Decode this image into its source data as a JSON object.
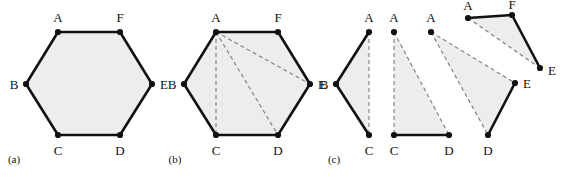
{
  "figure": {
    "width": 568,
    "height": 177,
    "background_color": "#ffffff",
    "fill_color": "#ededed",
    "solid_edge_color": "#111111",
    "dashed_edge_color": "#7d7d7d",
    "vertex_color": "#111111"
  },
  "panels": [
    {
      "id": "a",
      "caption": "(a)",
      "caption_pos": {
        "x": 14,
        "y": 159
      },
      "description": "convex hexagon ABCDEF",
      "polygon_points": "58,32 120,32 152,84 120,135 58,135 26,84",
      "solid_edges": [
        {
          "x1": 58,
          "y1": 32,
          "x2": 120,
          "y2": 32
        },
        {
          "x1": 120,
          "y1": 32,
          "x2": 152,
          "y2": 84
        },
        {
          "x1": 152,
          "y1": 84,
          "x2": 120,
          "y2": 135
        },
        {
          "x1": 120,
          "y1": 135,
          "x2": 58,
          "y2": 135
        },
        {
          "x1": 58,
          "y1": 135,
          "x2": 26,
          "y2": 84
        },
        {
          "x1": 26,
          "y1": 84,
          "x2": 58,
          "y2": 32
        }
      ],
      "dashed_edges": [],
      "vertices": [
        {
          "label": "A",
          "x": 58,
          "y": 32,
          "lx": 58,
          "ly": 17
        },
        {
          "label": "F",
          "x": 120,
          "y": 32,
          "lx": 120,
          "ly": 17
        },
        {
          "label": "E",
          "x": 152,
          "y": 84,
          "lx": 164,
          "ly": 84
        },
        {
          "label": "D",
          "x": 120,
          "y": 135,
          "lx": 120,
          "ly": 150
        },
        {
          "label": "C",
          "x": 58,
          "y": 135,
          "lx": 58,
          "ly": 150
        },
        {
          "label": "B",
          "x": 26,
          "y": 84,
          "lx": 14,
          "ly": 84
        }
      ]
    },
    {
      "id": "b",
      "caption": "(b)",
      "caption_pos": {
        "x": 175,
        "y": 159
      },
      "description": "hexagon ABCDEF with dashed diagonals from A to C, D and E",
      "polygon_points": "216,32 278,32 310,84 278,135 216,135 184,84",
      "solid_edges": [
        {
          "x1": 216,
          "y1": 32,
          "x2": 278,
          "y2": 32
        },
        {
          "x1": 278,
          "y1": 32,
          "x2": 310,
          "y2": 84
        },
        {
          "x1": 310,
          "y1": 84,
          "x2": 278,
          "y2": 135
        },
        {
          "x1": 278,
          "y1": 135,
          "x2": 216,
          "y2": 135
        },
        {
          "x1": 216,
          "y1": 135,
          "x2": 184,
          "y2": 84
        },
        {
          "x1": 184,
          "y1": 84,
          "x2": 216,
          "y2": 32
        }
      ],
      "dashed_edges": [
        {
          "x1": 216,
          "y1": 32,
          "x2": 216,
          "y2": 135
        },
        {
          "x1": 216,
          "y1": 32,
          "x2": 278,
          "y2": 135
        },
        {
          "x1": 216,
          "y1": 32,
          "x2": 310,
          "y2": 84
        }
      ],
      "vertices": [
        {
          "label": "A",
          "x": 216,
          "y": 32,
          "lx": 216,
          "ly": 17
        },
        {
          "label": "F",
          "x": 278,
          "y": 32,
          "lx": 278,
          "ly": 17
        },
        {
          "label": "E",
          "x": 310,
          "y": 84,
          "lx": 322,
          "ly": 84
        },
        {
          "label": "D",
          "x": 278,
          "y": 135,
          "lx": 278,
          "ly": 150
        },
        {
          "label": "C",
          "x": 216,
          "y": 135,
          "lx": 216,
          "ly": 150
        },
        {
          "label": "B",
          "x": 184,
          "y": 84,
          "lx": 172,
          "ly": 84
        }
      ]
    },
    {
      "id": "c",
      "caption": "(c)",
      "caption_pos": {
        "x": 334,
        "y": 159
      },
      "description": "the four triangles ABC, ACD, ADE and AEF obtained by the triangulation",
      "triangles": [
        {
          "name": "triangle-abc",
          "polygon_points": "369,32 336,84 369,135",
          "solid_edges": [
            {
              "x1": 369,
              "y1": 32,
              "x2": 336,
              "y2": 84
            },
            {
              "x1": 336,
              "y1": 84,
              "x2": 369,
              "y2": 135
            }
          ],
          "dashed_edges": [
            {
              "x1": 369,
              "y1": 32,
              "x2": 369,
              "y2": 135
            }
          ],
          "vertices": [
            {
              "label": "A",
              "x": 369,
              "y": 32,
              "lx": 369,
              "ly": 17
            },
            {
              "label": "B",
              "x": 336,
              "y": 84,
              "lx": 324,
              "ly": 84
            },
            {
              "label": "C",
              "x": 369,
              "y": 135,
              "lx": 369,
              "ly": 150
            }
          ]
        },
        {
          "name": "triangle-acd",
          "polygon_points": "394,32 394,135 449,135",
          "solid_edges": [
            {
              "x1": 394,
              "y1": 135,
              "x2": 449,
              "y2": 135
            }
          ],
          "dashed_edges": [
            {
              "x1": 394,
              "y1": 32,
              "x2": 394,
              "y2": 135
            },
            {
              "x1": 394,
              "y1": 32,
              "x2": 449,
              "y2": 135
            }
          ],
          "vertices": [
            {
              "label": "A",
              "x": 394,
              "y": 32,
              "lx": 394,
              "ly": 17
            },
            {
              "label": "C",
              "x": 394,
              "y": 135,
              "lx": 394,
              "ly": 150
            },
            {
              "label": "D",
              "x": 449,
              "y": 135,
              "lx": 449,
              "ly": 150
            }
          ]
        },
        {
          "name": "triangle-ade",
          "polygon_points": "431,32 488,135 515,83",
          "solid_edges": [
            {
              "x1": 488,
              "y1": 135,
              "x2": 515,
              "y2": 83
            }
          ],
          "dashed_edges": [
            {
              "x1": 431,
              "y1": 32,
              "x2": 488,
              "y2": 135
            },
            {
              "x1": 431,
              "y1": 32,
              "x2": 515,
              "y2": 83
            }
          ],
          "vertices": [
            {
              "label": "A",
              "x": 431,
              "y": 32,
              "lx": 431,
              "ly": 17
            },
            {
              "label": "D",
              "x": 488,
              "y": 135,
              "lx": 488,
              "ly": 150
            },
            {
              "label": "E",
              "x": 515,
              "y": 83,
              "lx": 527,
              "ly": 83
            }
          ]
        },
        {
          "name": "triangle-aef",
          "polygon_points": "468,18 512,15 540,68",
          "solid_edges": [
            {
              "x1": 468,
              "y1": 18,
              "x2": 512,
              "y2": 15
            },
            {
              "x1": 512,
              "y1": 15,
              "x2": 540,
              "y2": 68
            }
          ],
          "dashed_edges": [
            {
              "x1": 468,
              "y1": 18,
              "x2": 540,
              "y2": 68
            }
          ],
          "vertices": [
            {
              "label": "A",
              "x": 468,
              "y": 18,
              "lx": 468,
              "ly": 5
            },
            {
              "label": "F",
              "x": 512,
              "y": 15,
              "lx": 512,
              "ly": 4
            },
            {
              "label": "E",
              "x": 540,
              "y": 68,
              "lx": 552,
              "ly": 70
            }
          ]
        }
      ]
    }
  ]
}
